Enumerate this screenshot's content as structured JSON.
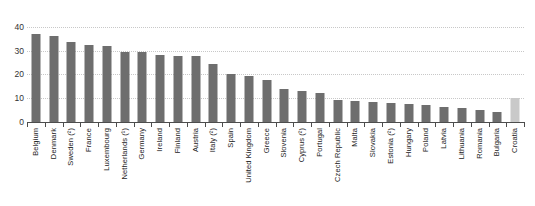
{
  "chart_data": {
    "type": "bar",
    "title": "",
    "subtitle": "",
    "xlabel": "",
    "ylabel": "",
    "ylim": [
      0,
      42
    ],
    "yticks": [
      0,
      10,
      20,
      30,
      40
    ],
    "ytick_labels": [
      "0",
      "10",
      "20",
      "30",
      "40"
    ],
    "grid": true,
    "grid_style": "dotted-horizontal",
    "legend": "none",
    "bar_color": "#6e6e6e",
    "highlight_color": "#c9c9c9",
    "highlight_category": "Croatia",
    "categories": [
      "Belgium",
      "Denmark",
      "Sweden (²)",
      "France",
      "Luxembourg",
      "Netherlands (¹)",
      "Germany",
      "Ireland",
      "Finland",
      "Austria",
      "Italy (²)",
      "Spain",
      "United Kingdom",
      "Greece",
      "Slovenia",
      "Cyprus (²)",
      "Portugal",
      "Czech Republic",
      "Malta",
      "Slovakia",
      "Estonia (²)",
      "Hungary",
      "Poland",
      "Latvia",
      "Lithuania",
      "Romania",
      "Bulgaria",
      "Croatia"
    ],
    "values": [
      37.0,
      36.3,
      33.5,
      32.3,
      31.8,
      29.5,
      29.2,
      28.2,
      27.8,
      27.6,
      24.5,
      20.1,
      19.2,
      17.8,
      13.8,
      13.2,
      12.2,
      9.3,
      8.9,
      8.2,
      7.9,
      7.6,
      7.3,
      6.4,
      5.7,
      5.1,
      4.0,
      10.1
    ]
  },
  "axis": {
    "y_tick_0": "0",
    "y_tick_10": "10",
    "y_tick_20": "20",
    "y_tick_30": "30",
    "y_tick_40": "40"
  }
}
